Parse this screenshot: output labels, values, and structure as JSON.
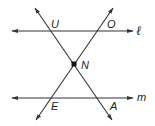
{
  "diagram": {
    "type": "geometry",
    "colors": {
      "stroke": "#333333",
      "background": "#ffffff",
      "point": "#111111"
    },
    "lines": [
      {
        "name": "l",
        "label": "ℓ",
        "kind": "horizontal-line",
        "from": [
          12,
          31
        ],
        "to": [
          133,
          31
        ]
      },
      {
        "name": "m",
        "label": "m",
        "kind": "horizontal-line",
        "from": [
          12,
          98
        ],
        "to": [
          133,
          98
        ]
      },
      {
        "name": "UA",
        "kind": "transversal",
        "from": [
          35,
          8
        ],
        "to": [
          112,
          120
        ]
      },
      {
        "name": "OE",
        "kind": "transversal",
        "from": [
          113,
          8
        ],
        "to": [
          36,
          120
        ]
      }
    ],
    "points": [
      {
        "name": "U",
        "label": "U",
        "pos": [
          49,
          31
        ]
      },
      {
        "name": "O",
        "label": "O",
        "pos": [
          98,
          31
        ]
      },
      {
        "name": "N",
        "label": "N",
        "pos": [
          74,
          64
        ],
        "marked": true
      },
      {
        "name": "E",
        "label": "E",
        "pos": [
          51,
          98
        ]
      },
      {
        "name": "A",
        "label": "A",
        "pos": [
          97,
          98
        ]
      }
    ],
    "labels": {
      "U": "U",
      "O": "O",
      "N": "N",
      "E": "E",
      "A": "A",
      "l": "ℓ",
      "m": "m"
    }
  }
}
